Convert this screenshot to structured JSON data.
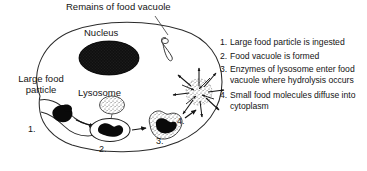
{
  "figure": {
    "title_labels": {
      "remains": "Remains of food vacuole",
      "nucleus": "Nucleus",
      "lysosome": "Lysosome",
      "large_food_particle": "Large food\nparticle"
    },
    "step_markers": [
      "1.",
      "2.",
      "3.",
      "4."
    ],
    "steps": [
      {
        "number": "1.",
        "text": "Large food particle is ingested"
      },
      {
        "number": "2.",
        "text": "Food vacuole is formed"
      },
      {
        "number": "3.",
        "text": "Enzymes of lysosome enter food vacuole where hydrolysis occurs"
      },
      {
        "number": "4.",
        "text": "Small food molecules diffuse into cytoplasm"
      }
    ],
    "colors": {
      "background": "#ffffff",
      "ink": "#141414",
      "outline": "#2b2b2b",
      "nucleus_fill": "#0d0d0d",
      "food_fill": "#0a0a0a",
      "stipple": "#555555"
    },
    "icons": {
      "cell": "cell-outline-icon",
      "nucleus": "nucleus-icon",
      "lysosome": "lysosome-icon",
      "food_vacuole": "food-vacuole-icon",
      "remains": "remains-vacuole-icon",
      "diffusion": "diffusion-burst-icon",
      "arrow": "arrow-icon",
      "leader": "leader-line-icon"
    }
  }
}
